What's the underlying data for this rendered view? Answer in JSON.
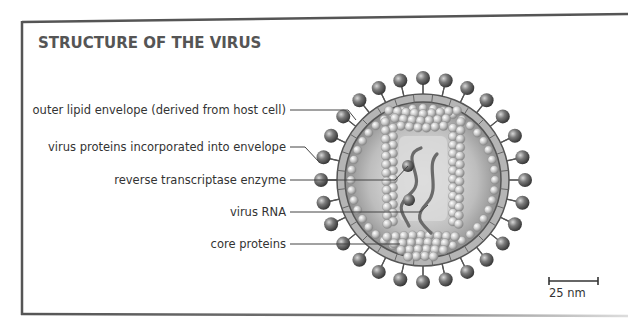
{
  "title": "STRUCTURE OF THE VIRUS",
  "labels": [
    {
      "id": "outer-lipid-envelope",
      "text": "outer lipid envelope (derived from host cell)",
      "y": 105
    },
    {
      "id": "virus-proteins",
      "text": "virus proteins incorporated into envelope",
      "y": 145
    },
    {
      "id": "reverse-transcriptase",
      "text": "reverse transcriptase enzyme",
      "y": 177
    },
    {
      "id": "virus-rna",
      "text": "virus RNA",
      "y": 209
    },
    {
      "id": "core-proteins",
      "text": "core proteins",
      "y": 242
    }
  ],
  "scale_bar": {
    "label": "25 nm"
  },
  "colors": {
    "frame": "#555555",
    "text": "#333333",
    "sphere": "#6a6a6a",
    "envelope": "#b8b8b8"
  }
}
